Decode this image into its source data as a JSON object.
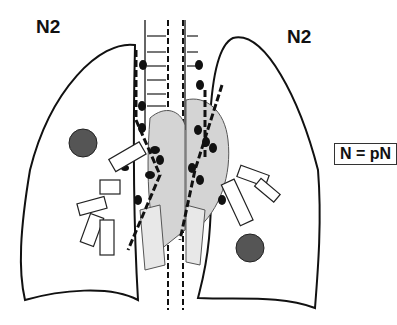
{
  "diagram": {
    "title_left": "N2",
    "title_right": "N2",
    "legend": "N = pN",
    "colors": {
      "outline": "#111111",
      "fill_gray": "#d0d0d0",
      "node": "#111111",
      "tumor": "#444444"
    }
  }
}
